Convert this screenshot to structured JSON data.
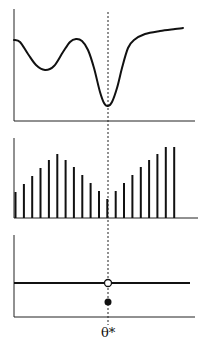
{
  "figure": {
    "marker_label": "θ*",
    "colors": {
      "ink": "#111111",
      "background": "#ffffff"
    }
  },
  "panels": {
    "top": {
      "description": "objective curve with multiple local minima; global minimum at θ*",
      "curve_points": [
        [
          14,
          40
        ],
        [
          20,
          42
        ],
        [
          28,
          54
        ],
        [
          36,
          65
        ],
        [
          45,
          70
        ],
        [
          54,
          66
        ],
        [
          63,
          52
        ],
        [
          70,
          42
        ],
        [
          76,
          39
        ],
        [
          82,
          41
        ],
        [
          88,
          50
        ],
        [
          94,
          68
        ],
        [
          100,
          92
        ],
        [
          104,
          103
        ],
        [
          108,
          106
        ],
        [
          112,
          102
        ],
        [
          117,
          88
        ],
        [
          122,
          68
        ],
        [
          128,
          48
        ],
        [
          134,
          40
        ],
        [
          145,
          34
        ],
        [
          160,
          31
        ],
        [
          175,
          29
        ],
        [
          183,
          28
        ]
      ]
    },
    "middle": {
      "description": "discrete bar samples; heights decrease toward θ* then increase",
      "bar_heights": [
        26,
        34,
        42,
        50,
        58,
        64,
        58,
        51,
        43,
        35,
        27,
        19,
        27,
        35,
        43,
        51,
        58,
        64,
        71,
        71
      ]
    },
    "bottom": {
      "description": "constant function with open circle at θ* and filled dot below (discontinuity)",
      "line_y": 283,
      "open_circle": [
        108,
        283
      ],
      "filled_dot": [
        108,
        302
      ]
    }
  }
}
